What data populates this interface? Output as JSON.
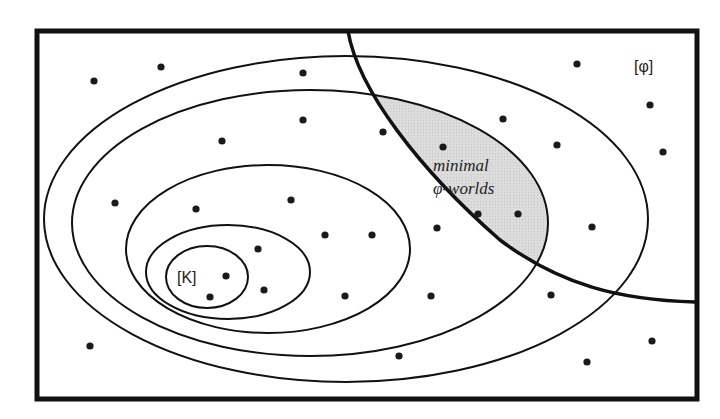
{
  "diagram": {
    "type": "nested-spheres-of-worlds",
    "colors": {
      "stroke": "#111111",
      "dot": "#1a1a1a",
      "shaded_region": "#d9d9d9",
      "background": "#ffffff"
    },
    "labels": {
      "phi_set": "[φ]",
      "k_set": "[K]",
      "shaded_line1": "minimal",
      "shaded_line2": "φ-worlds"
    },
    "frame": {
      "x": 37,
      "y": 31,
      "width": 660,
      "height": 368
    },
    "spheres": [
      {
        "name": "sphere-5",
        "cx": 346,
        "cy": 219,
        "rx": 302,
        "ry": 163
      },
      {
        "name": "sphere-4",
        "cx": 310,
        "cy": 223,
        "rx": 238,
        "ry": 133
      },
      {
        "name": "sphere-3",
        "cx": 268,
        "cy": 249,
        "rx": 142,
        "ry": 84
      },
      {
        "name": "sphere-2",
        "cx": 228,
        "cy": 272,
        "rx": 82,
        "ry": 47
      },
      {
        "name": "sphere-1-K",
        "cx": 207,
        "cy": 277,
        "rx": 41,
        "ry": 31
      }
    ],
    "worlds": [
      [
        94,
        81
      ],
      [
        161,
        67
      ],
      [
        303,
        73
      ],
      [
        577,
        64
      ],
      [
        650,
        105
      ],
      [
        663,
        152
      ],
      [
        222,
        141
      ],
      [
        303,
        120
      ],
      [
        383,
        132
      ],
      [
        443,
        147
      ],
      [
        503,
        119
      ],
      [
        557,
        145
      ],
      [
        115,
        203
      ],
      [
        196,
        209
      ],
      [
        291,
        200
      ],
      [
        325,
        235
      ],
      [
        372,
        235
      ],
      [
        437,
        228
      ],
      [
        478,
        214
      ],
      [
        518,
        214
      ],
      [
        592,
        227
      ],
      [
        258,
        249
      ],
      [
        226,
        276
      ],
      [
        264,
        290
      ],
      [
        210,
        297
      ],
      [
        345,
        296
      ],
      [
        431,
        296
      ],
      [
        551,
        295
      ],
      [
        90,
        346
      ],
      [
        399,
        356
      ],
      [
        587,
        362
      ],
      [
        652,
        341
      ]
    ]
  }
}
